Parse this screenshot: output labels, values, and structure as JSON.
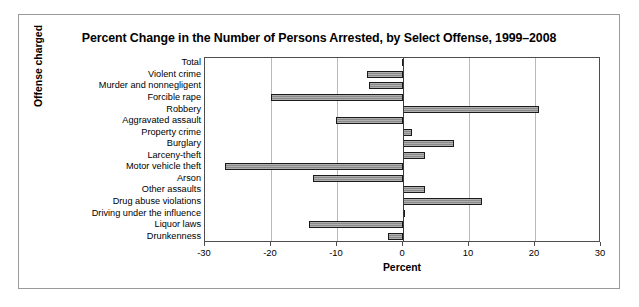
{
  "figure": {
    "title": "Percent Change in the Number of Persons Arrested, by Select Offense, 1999–2008",
    "xlabel": "Percent",
    "ylabel": "Offense charged"
  },
  "axis": {
    "ticks": [
      "-30",
      "-20",
      "-10",
      "0",
      "10",
      "20",
      "30"
    ]
  },
  "chart_data": {
    "type": "bar",
    "orientation": "horizontal",
    "title": "Percent Change in the Number of Persons Arrested, by Select Offense, 1999–2008",
    "xlabel": "Percent",
    "ylabel": "Offense charged",
    "xlim": [
      -30,
      30
    ],
    "xticks": [
      -30,
      -20,
      -10,
      0,
      10,
      20,
      30
    ],
    "grid": true,
    "legend": "none",
    "categories": [
      "Total",
      "Violent crime",
      "Murder and nonnegligent",
      "Forcible rape",
      "Robbery",
      "Aggravated assault",
      "Property crime",
      "Burglary",
      "Larceny-theft",
      "Motor vehicle theft",
      "Arson",
      "Other assaults",
      "Drug abuse violations",
      "Driving under the influence",
      "Liquor laws",
      "Drunkenness"
    ],
    "values": [
      -0.2,
      -5.5,
      -5.2,
      -20.0,
      20.6,
      -10.2,
      1.3,
      7.7,
      3.3,
      -27.0,
      -13.6,
      3.3,
      12.0,
      0.2,
      -14.3,
      -2.3
    ]
  }
}
